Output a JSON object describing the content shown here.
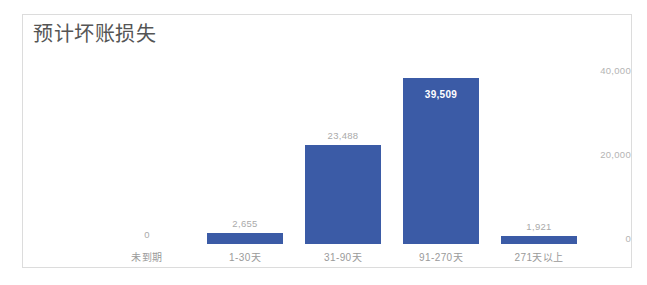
{
  "card": {
    "title": "预计坏账损失",
    "border_color": "#dcdcdc",
    "background": "#ffffff"
  },
  "chart_data": {
    "type": "bar",
    "title": "预计坏账损失",
    "xlabel": "",
    "ylabel": "",
    "categories": [
      "未到期",
      "1-30天",
      "31-90天",
      "91-270天",
      "271天以上"
    ],
    "values": [
      0,
      2655,
      23488,
      39509,
      1921
    ],
    "value_labels": [
      "0",
      "2,655",
      "23,488",
      "39,509",
      "1,921"
    ],
    "label_positions": [
      "outside",
      "outside",
      "outside",
      "inside",
      "outside"
    ],
    "ylim": [
      0,
      44000
    ],
    "yticks": [
      40000,
      20000,
      0
    ],
    "ytick_labels": [
      "40,000",
      "20,000",
      "0"
    ],
    "grid": false,
    "legend": false,
    "bar_color": "#3b5ba6",
    "axis_label_color": "#9a9a9a",
    "data_label_color": "#aaaaaa",
    "inside_label_color": "#ffffff",
    "title_color": "#555555"
  }
}
